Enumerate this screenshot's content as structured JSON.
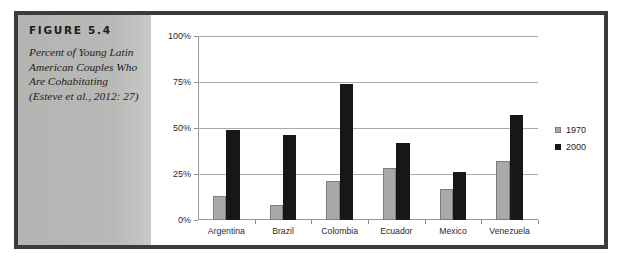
{
  "figure": {
    "label": "FIGURE 5.4",
    "caption": "Percent of Young Latin American Couples Who Are Cohabitating (Esteve et al., 2012: 27)"
  },
  "colors": {
    "series_1970": "#a9a9a7",
    "series_2000": "#171717",
    "panel_bg": "#b8b8b6",
    "frame_border": "#3b3b3b",
    "gridline": "#a9a9a9"
  },
  "chart_data": {
    "type": "bar",
    "title": "",
    "xlabel": "",
    "ylabel": "",
    "categories": [
      "Argentina",
      "Brazil",
      "Colombia",
      "Ecuador",
      "Mexico",
      "Venezuela"
    ],
    "series": [
      {
        "name": "1970",
        "values": [
          13,
          8,
          21,
          28,
          17,
          32
        ]
      },
      {
        "name": "2000",
        "values": [
          49,
          46,
          74,
          42,
          26,
          57
        ]
      }
    ],
    "ylim": [
      0,
      100
    ],
    "yticks": [
      0,
      25,
      50,
      75,
      100
    ],
    "ytick_labels": [
      "0%",
      "25%",
      "50%",
      "75%",
      "100%"
    ],
    "grid": true,
    "legend_position": "right",
    "legend": [
      "1970",
      "2000"
    ]
  }
}
